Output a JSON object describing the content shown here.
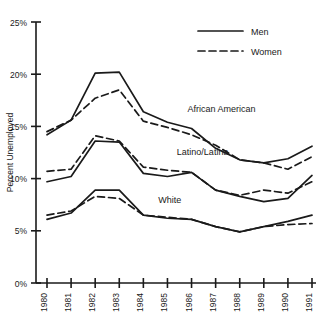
{
  "chart_data": {
    "type": "line",
    "title": "",
    "xlabel": "",
    "ylabel": "Percent Unemployed",
    "x": [
      "1980",
      "1981",
      "1982",
      "1983",
      "1984",
      "1985",
      "1986",
      "1987",
      "1988",
      "1989",
      "1990",
      "1991"
    ],
    "xtick_labels": [
      "1980",
      "1981",
      "1982",
      "1983",
      "1984",
      "1985",
      "1986",
      "1987",
      "1988",
      "1989",
      "1990",
      "1991"
    ],
    "ytick_labels": [
      "0%",
      "5%",
      "10%",
      "15%",
      "20%",
      "25%"
    ],
    "ytick_values": [
      0,
      5,
      10,
      15,
      20,
      25
    ],
    "ylim": [
      0,
      25
    ],
    "grid": false,
    "legend_position": "top-right",
    "legend": [
      {
        "label": "Men",
        "style": "solid"
      },
      {
        "label": "Women",
        "style": "dashed"
      }
    ],
    "group_annotations": [
      {
        "text": "African American",
        "x_frac": 0.53,
        "y_value": 16.4
      },
      {
        "text": "Latino/Latina",
        "x_frac": 0.49,
        "y_value": 12.3
      },
      {
        "text": "White",
        "x_frac": 0.42,
        "y_value": 7.7
      }
    ],
    "series": [
      {
        "name": "African American Men",
        "group": "African American",
        "gender": "Men",
        "style": "solid",
        "values": [
          14.2,
          15.6,
          20.1,
          20.2,
          16.4,
          15.4,
          14.8,
          12.9,
          11.8,
          11.5,
          11.9,
          13.1
        ]
      },
      {
        "name": "African American Women",
        "group": "African American",
        "gender": "Women",
        "style": "dashed",
        "values": [
          14.5,
          15.6,
          17.7,
          18.5,
          15.5,
          14.9,
          14.2,
          13.2,
          11.8,
          11.5,
          10.9,
          12.1
        ]
      },
      {
        "name": "Latino Men",
        "group": "Latino/Latina",
        "gender": "Men",
        "style": "solid",
        "values": [
          9.7,
          10.2,
          13.6,
          13.5,
          10.5,
          10.2,
          10.6,
          8.9,
          8.3,
          7.8,
          8.1,
          10.3
        ]
      },
      {
        "name": "Latina Women",
        "group": "Latino/Latina",
        "gender": "Women",
        "style": "dashed",
        "values": [
          10.7,
          10.9,
          14.1,
          13.6,
          11.1,
          10.8,
          10.6,
          8.9,
          8.4,
          8.9,
          8.6,
          9.7
        ]
      },
      {
        "name": "White Men",
        "group": "White",
        "gender": "Men",
        "style": "solid",
        "values": [
          6.1,
          6.7,
          8.9,
          8.9,
          6.5,
          6.2,
          6.1,
          5.4,
          4.9,
          5.4,
          5.9,
          6.5
        ]
      },
      {
        "name": "White Women",
        "group": "White",
        "gender": "Women",
        "style": "dashed",
        "values": [
          6.5,
          6.9,
          8.3,
          8.1,
          6.5,
          6.3,
          6.1,
          5.4,
          4.9,
          5.4,
          5.6,
          5.7
        ]
      }
    ]
  }
}
